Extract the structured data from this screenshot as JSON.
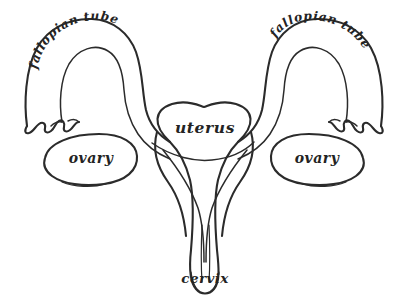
{
  "figure": {
    "style": "hand-drawn ink line drawing",
    "background_color": "#ffffff",
    "ink_color": "#2b2b2b"
  },
  "labels": {
    "uterus": "uterus",
    "cervix": "cervix",
    "ovary_left": "ovary",
    "ovary_right": "ovary",
    "fallopian_tube_left": "fallopian tube",
    "fallopian_tube_right": "fallopian tube"
  },
  "parts": [
    {
      "name": "fallopian-tube-left",
      "label": "fallopian tube"
    },
    {
      "name": "fallopian-tube-right",
      "label": "fallopian tube"
    },
    {
      "name": "ovary-left",
      "label": "ovary"
    },
    {
      "name": "ovary-right",
      "label": "ovary"
    },
    {
      "name": "uterus",
      "label": "uterus"
    },
    {
      "name": "cervix",
      "label": "cervix"
    }
  ]
}
